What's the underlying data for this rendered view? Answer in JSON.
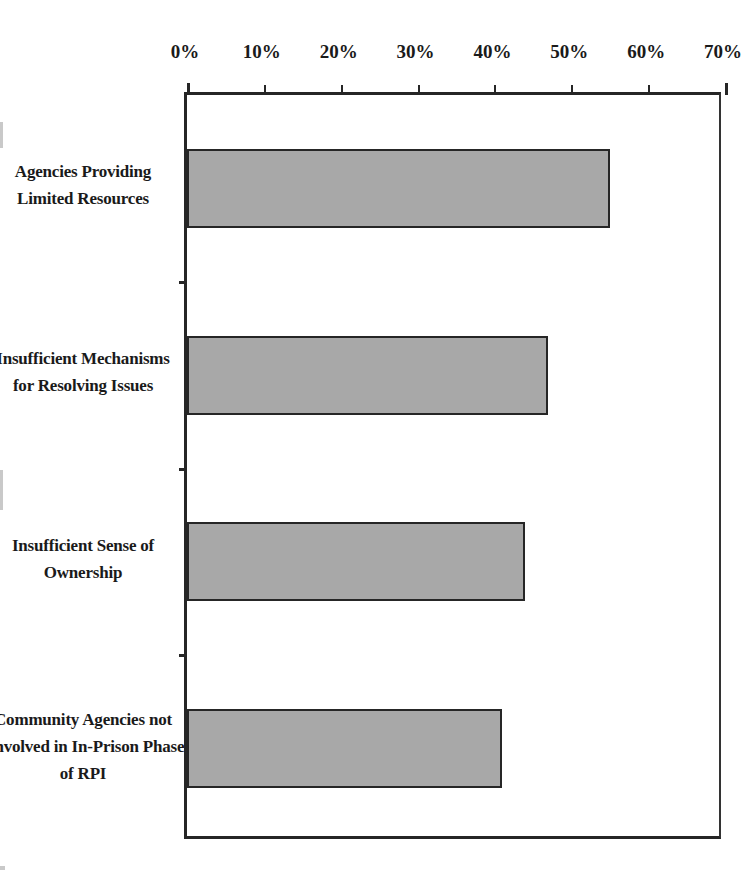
{
  "chart_data": {
    "type": "bar",
    "orientation": "horizontal",
    "title": "",
    "subtitle": "",
    "xlabel": "",
    "ylabel": "",
    "categories": [
      "Agencies Providing Limited Resources",
      "Insufficient Mechanisms for Resolving Issues",
      "Insufficient Sense of Ownership",
      "Community Agencies not Involved in In-Prison Phase of RPI"
    ],
    "values": [
      55,
      47,
      44,
      41
    ],
    "value_unit": "%",
    "xlim": [
      0,
      70
    ],
    "xticks": [
      0,
      10,
      20,
      30,
      40,
      50,
      60,
      70
    ],
    "xticklabels": [
      "0%",
      "10%",
      "20%",
      "30%",
      "40%",
      "50%",
      "60%",
      "70%"
    ],
    "grid": false,
    "legend": false,
    "legend_position": "none",
    "bar_fill_color": "#a8a8a8",
    "bar_border_color": "#262626",
    "axis_color": "#262626",
    "background_color": "#ffffff"
  },
  "axis": {
    "tick_labels": [
      {
        "text": "0%",
        "value": 0
      },
      {
        "text": "10%",
        "value": 10
      },
      {
        "text": "20%",
        "value": 20
      },
      {
        "text": "30%",
        "value": 30
      },
      {
        "text": "40%",
        "value": 40
      },
      {
        "text": "50%",
        "value": 50
      },
      {
        "text": "60%",
        "value": 60
      },
      {
        "text": "70%",
        "value": 70
      }
    ]
  },
  "categories": [
    {
      "id": "agencies-providing-limited-resources",
      "value": 55,
      "lines": [
        "Agencies Providing",
        "Limited Resources"
      ]
    },
    {
      "id": "insufficient-mechanisms-for-resolving-issues",
      "value": 47,
      "lines": [
        "Insufficient Mechanisms",
        "for Resolving Issues"
      ]
    },
    {
      "id": "insufficient-sense-of-ownership",
      "value": 44,
      "lines": [
        "Insufficient Sense of",
        "Ownership"
      ]
    },
    {
      "id": "community-agencies-not-involved-in-in-prison-phase-of-rpi",
      "value": 41,
      "lines": [
        "Community Agencies not",
        "Involved in In-Prison Phase",
        "of RPI"
      ]
    }
  ]
}
